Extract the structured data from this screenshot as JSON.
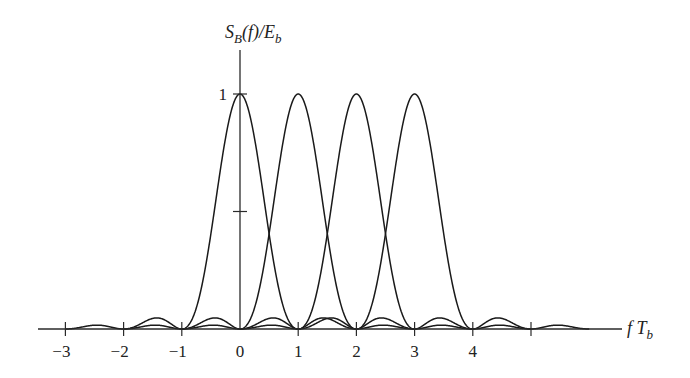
{
  "chart_data": {
    "type": "line",
    "title": "",
    "xlabel": "fT_b",
    "ylabel": "S_B(f)/E_b",
    "x_ticks": [
      -3,
      -2,
      -1,
      0,
      1,
      2,
      3,
      4,
      5
    ],
    "x_tick_labels": [
      "−3",
      "−2",
      "−1",
      "0",
      "1",
      "2",
      "3",
      "4",
      ""
    ],
    "y_ticks": [
      0.5,
      1
    ],
    "y_tick_labels": [
      "",
      "1"
    ],
    "xlim": [
      -3.5,
      6.7
    ],
    "ylim": [
      0,
      1.2
    ],
    "grid": false,
    "legend": null,
    "series": [
      {
        "name": "sinc^2(fT_b - 0)",
        "center": 0,
        "x_range": [
          -3,
          3
        ],
        "peak": 1
      },
      {
        "name": "sinc^2(fT_b - 1)",
        "center": 1,
        "x_range": [
          -2,
          4
        ],
        "peak": 1
      },
      {
        "name": "sinc^2(fT_b - 2)",
        "center": 2,
        "x_range": [
          -1,
          5
        ],
        "peak": 1
      },
      {
        "name": "sinc^2(fT_b - 3)",
        "center": 3,
        "x_range": [
          0,
          6
        ],
        "peak": 1
      }
    ]
  },
  "labels": {
    "ylabel_main": "S",
    "ylabel_sub": "B",
    "ylabel_mid": "(f)/E",
    "ylabel_sub2": "b",
    "xlabel_main": "f T",
    "xlabel_sub": "b"
  }
}
